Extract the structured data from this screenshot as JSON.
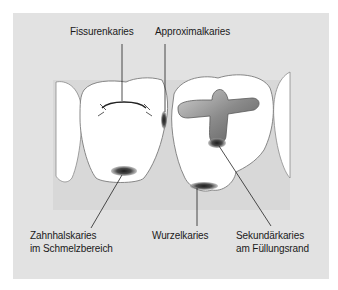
{
  "figure": {
    "background_color": "#e2e2e2",
    "tooth_fill": "#ffffff",
    "gum_color": "#d2d2d2",
    "caries_color": "#2a2a2a"
  },
  "labels": {
    "fissure": "Fissurenkaries",
    "approximal": "Approximalkaries",
    "cervical_line1": "Zahnhalskaries",
    "cervical_line2": "im Schmelzbereich",
    "root": "Wurzelkaries",
    "secondary_line1": "Sekundärkaries",
    "secondary_line2": "am Füllungsrand"
  }
}
